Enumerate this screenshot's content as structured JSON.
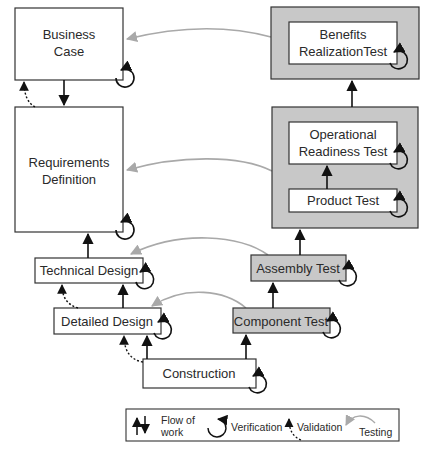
{
  "diagram": {
    "colors": {
      "box_fill": "#ffffff",
      "test_fill": "#c8c8c8",
      "stroke": "#333333",
      "testing_arrow": "#a9a9a9",
      "arrow": "#111111"
    },
    "left_stages": {
      "business_case": {
        "line1": "Business",
        "line2": "Case"
      },
      "requirements": {
        "line1": "Requirements",
        "line2": "Definition"
      },
      "technical_design": {
        "label": "Technical Design"
      },
      "detailed_design": {
        "label": "Detailed Design"
      },
      "construction": {
        "label": "Construction"
      }
    },
    "right_stages": {
      "benefits": {
        "line1": "Benefits",
        "line2": "RealizationTest"
      },
      "operational": {
        "line1": "Operational",
        "line2": "Readiness Test"
      },
      "product_test": {
        "label": "Product Test"
      },
      "assembly_test": {
        "label": "Assembly Test"
      },
      "component_test": {
        "label": "Component Test"
      }
    },
    "legend": {
      "flow_line1": "Flow of",
      "flow_line2": "work",
      "verification": "Verification",
      "validation": "Validation",
      "testing": "Testing"
    }
  }
}
